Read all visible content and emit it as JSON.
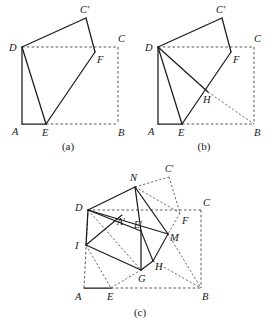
{
  "document": {
    "type": "geometry-figure-set",
    "description": "Three paper-folding geometry diagrams of square ABCD",
    "background_color": "#ffffff",
    "line_color": "#1b1b1b",
    "dash_color": "#5a5a5a"
  },
  "figures": [
    {
      "id": "a",
      "caption": "(a)",
      "labels": {
        "A": "A",
        "B": "B",
        "C": "C",
        "D": "D",
        "E": "E",
        "F": "F",
        "Cp": "C′"
      },
      "points": {
        "A": [
          22,
          124
        ],
        "B": [
          118,
          124
        ],
        "C": [
          118,
          47
        ],
        "D": [
          22,
          47
        ],
        "E": [
          46,
          124
        ],
        "F": [
          95,
          52
        ],
        "Cp": [
          86,
          18
        ]
      },
      "solid_edges": [
        [
          "A",
          "E"
        ],
        [
          "A",
          "D"
        ],
        [
          "D",
          "E"
        ],
        [
          "E",
          "F"
        ],
        [
          "D",
          "Cp"
        ],
        [
          "Cp",
          "F"
        ]
      ],
      "dashed_edges": [
        [
          "D",
          "C"
        ],
        [
          "C",
          "B"
        ],
        [
          "E",
          "B"
        ]
      ]
    },
    {
      "id": "b",
      "caption": "(b)",
      "labels": {
        "A": "A",
        "B": "B",
        "C": "C",
        "D": "D",
        "E": "E",
        "F": "F",
        "H": "H",
        "Cp": "C′"
      },
      "points": {
        "A": [
          22,
          124
        ],
        "B": [
          118,
          124
        ],
        "C": [
          118,
          47
        ],
        "D": [
          22,
          47
        ],
        "E": [
          46,
          124
        ],
        "F": [
          95,
          52
        ],
        "H": [
          72,
          92
        ],
        "Cp": [
          86,
          18
        ]
      },
      "solid_edges": [
        [
          "A",
          "E"
        ],
        [
          "A",
          "D"
        ],
        [
          "D",
          "E"
        ],
        [
          "D",
          "H"
        ],
        [
          "E",
          "F"
        ],
        [
          "D",
          "Cp"
        ],
        [
          "Cp",
          "F"
        ]
      ],
      "dashed_edges": [
        [
          "D",
          "C"
        ],
        [
          "C",
          "B"
        ],
        [
          "E",
          "B"
        ],
        [
          "H",
          "B"
        ]
      ]
    },
    {
      "id": "c",
      "caption": "(c)",
      "labels": {
        "A": "A",
        "B": "B",
        "C": "C",
        "D": "D",
        "E": "E",
        "F": "F",
        "G": "G",
        "H": "H",
        "I": "I",
        "M": "M",
        "N": "N",
        "Ap": "A′",
        "Ep": "E′",
        "Cp": "C′"
      },
      "points": {
        "A": [
          28,
          130
        ],
        "B": [
          145,
          130
        ],
        "C": [
          145,
          52
        ],
        "D": [
          32,
          52
        ],
        "E": [
          55,
          130
        ],
        "F": [
          124,
          55
        ],
        "G": [
          85,
          112
        ],
        "H": [
          97,
          103
        ],
        "I": [
          30,
          87
        ],
        "M": [
          112,
          76
        ],
        "N": [
          79,
          29
        ],
        "Ap": [
          66,
          57
        ],
        "Ep": [
          85,
          73
        ],
        "Cp": [
          113,
          19
        ]
      },
      "solid_edges": [
        [
          "A",
          "E"
        ],
        [
          "D",
          "N"
        ],
        [
          "N",
          "M"
        ],
        [
          "D",
          "I"
        ],
        [
          "I",
          "G"
        ],
        [
          "G",
          "H"
        ],
        [
          "H",
          "M"
        ],
        [
          "N",
          "Ep"
        ],
        [
          "Ap",
          "M"
        ],
        [
          "D",
          "Ap"
        ],
        [
          "Ep",
          "G"
        ],
        [
          "Ep",
          "H"
        ],
        [
          "D",
          "Ep"
        ],
        [
          "I",
          "Ap"
        ]
      ],
      "dashed_edges": [
        [
          "D",
          "C"
        ],
        [
          "C",
          "B"
        ],
        [
          "E",
          "B"
        ],
        [
          "A",
          "D"
        ],
        [
          "A",
          "I"
        ],
        [
          "I",
          "E"
        ],
        [
          "E",
          "G"
        ],
        [
          "D",
          "G"
        ],
        [
          "N",
          "Cp"
        ],
        [
          "Cp",
          "F"
        ],
        [
          "F",
          "M"
        ],
        [
          "N",
          "F"
        ],
        [
          "M",
          "B"
        ],
        [
          "G",
          "B"
        ],
        [
          "H",
          "B"
        ]
      ]
    }
  ]
}
